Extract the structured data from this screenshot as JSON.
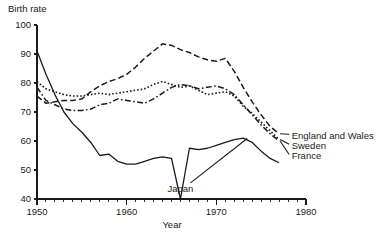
{
  "chart_data": {
    "type": "line",
    "title": "",
    "xlabel": "Year",
    "ylabel": "Birth rate",
    "xlim": [
      1950,
      1980
    ],
    "ylim": [
      40,
      100
    ],
    "grid": false,
    "legend_position": "right-inline-labels",
    "x_ticks_major": [
      1950,
      1960,
      1970,
      1980
    ],
    "x_tick_labels": [
      "1950",
      "1960",
      "1970",
      "1980"
    ],
    "x_minor_tick_step": 1,
    "y_ticks": [
      40,
      50,
      60,
      70,
      80,
      90,
      100
    ],
    "y_tick_labels": [
      "40",
      "50",
      "60",
      "70",
      "80",
      "90",
      "100"
    ],
    "series": [
      {
        "name": "England and Wales",
        "style": "dashed",
        "label_x": 1978.4,
        "label_y": 62.0,
        "x": [
          1950,
          1951,
          1952,
          1953,
          1954,
          1955,
          1956,
          1957,
          1958,
          1959,
          1960,
          1961,
          1962,
          1963,
          1964,
          1965,
          1966,
          1967,
          1968,
          1969,
          1970,
          1971,
          1972,
          1973,
          1974,
          1975,
          1976,
          1977
        ],
        "y": [
          75.5,
          73.0,
          73.5,
          74.0,
          74.0,
          74.5,
          77.0,
          79.0,
          80.5,
          81.5,
          83.0,
          85.5,
          88.5,
          91.0,
          93.5,
          93.0,
          91.5,
          90.5,
          89.0,
          88.0,
          87.5,
          88.5,
          84.0,
          78.5,
          73.5,
          69.0,
          65.0,
          62.5
        ]
      },
      {
        "name": "Sweden",
        "style": "dotted",
        "label_x": 1978.4,
        "label_y": 58.5,
        "x": [
          1950,
          1951,
          1952,
          1953,
          1954,
          1955,
          1956,
          1957,
          1958,
          1959,
          1960,
          1961,
          1962,
          1963,
          1964,
          1965,
          1966,
          1967,
          1968,
          1969,
          1970,
          1971,
          1972,
          1973,
          1974,
          1975,
          1976,
          1977
        ],
        "y": [
          80.5,
          78.0,
          77.0,
          76.0,
          75.5,
          75.5,
          76.0,
          76.5,
          76.0,
          76.5,
          77.0,
          77.5,
          78.0,
          79.5,
          80.5,
          79.5,
          78.5,
          79.0,
          77.5,
          76.0,
          76.5,
          77.0,
          75.5,
          72.0,
          69.5,
          66.5,
          63.5,
          60.5
        ]
      },
      {
        "name": "France",
        "style": "dashdot",
        "label_x": 1978.4,
        "label_y": 55.0,
        "x": [
          1950,
          1951,
          1952,
          1953,
          1954,
          1955,
          1956,
          1957,
          1958,
          1959,
          1960,
          1961,
          1962,
          1963,
          1964,
          1965,
          1966,
          1967,
          1968,
          1969,
          1970,
          1971,
          1972,
          1973,
          1974,
          1975,
          1976,
          1977
        ],
        "y": [
          78.5,
          74.0,
          72.5,
          71.0,
          70.5,
          70.5,
          71.0,
          72.5,
          73.0,
          74.5,
          74.0,
          73.5,
          73.0,
          74.5,
          76.5,
          78.5,
          79.5,
          79.0,
          78.0,
          78.5,
          79.0,
          78.0,
          76.0,
          72.5,
          69.0,
          65.5,
          62.5,
          60.0
        ]
      },
      {
        "name": "Japan",
        "style": "solid",
        "label_x": 1966.0,
        "label_y": 43.5,
        "x": [
          1950,
          1951,
          1952,
          1953,
          1954,
          1955,
          1956,
          1957,
          1958,
          1959,
          1960,
          1961,
          1962,
          1963,
          1964,
          1965,
          1966,
          1967,
          1968,
          1969,
          1970,
          1971,
          1972,
          1973,
          1974,
          1975,
          1976,
          1977
        ],
        "y": [
          91.0,
          83.0,
          76.0,
          70.0,
          66.0,
          63.0,
          59.5,
          55.0,
          55.5,
          53.0,
          52.0,
          52.0,
          53.0,
          54.0,
          54.5,
          54.0,
          40.0,
          57.5,
          57.0,
          57.5,
          58.5,
          59.5,
          60.5,
          61.0,
          59.5,
          56.5,
          54.0,
          52.5
        ]
      }
    ]
  }
}
